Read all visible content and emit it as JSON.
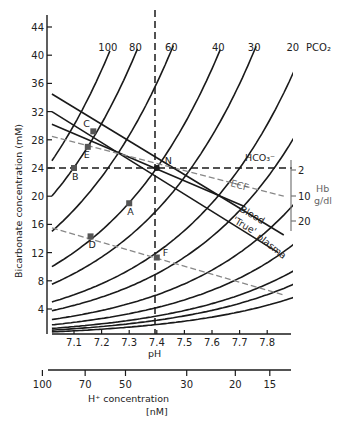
{
  "chart_data": {
    "type": "line",
    "title": "",
    "xlabel": "pH",
    "ylabel": "Bicarbonate concentration (mM)",
    "secondary_xlabel": "H⁺ concentration",
    "secondary_xlabel_unit": "[nM]",
    "xlim": [
      7.0,
      7.9
    ],
    "ylim": [
      0,
      46
    ],
    "x_ticks": [
      7.1,
      7.2,
      7.3,
      7.4,
      7.5,
      7.6,
      7.7,
      7.8
    ],
    "y_ticks": [
      4,
      8,
      12,
      16,
      20,
      24,
      28,
      32,
      36,
      40,
      44
    ],
    "h_ion_ticks": [
      100,
      70,
      50,
      30,
      20,
      15
    ],
    "grid": false,
    "isopleth_label": "PCO₂",
    "series": [
      {
        "name": "PCO2 100",
        "pco2": 100,
        "labeled": true
      },
      {
        "name": "PCO2 80",
        "pco2": 80,
        "labeled": true
      },
      {
        "name": "PCO2 60",
        "pco2": 60,
        "labeled": true
      },
      {
        "name": "PCO2 40",
        "pco2": 40,
        "labeled": true
      },
      {
        "name": "PCO2 30",
        "pco2": 30,
        "labeled": true
      },
      {
        "name": "PCO2 20",
        "pco2": 20,
        "labeled": true
      },
      {
        "name": "PCO2 15",
        "pco2": 15,
        "labeled": false
      },
      {
        "name": "PCO2 10",
        "pco2": 10,
        "labeled": false
      },
      {
        "name": "PCO2 7",
        "pco2": 7,
        "labeled": false
      },
      {
        "name": "PCO2 5",
        "pco2": 5,
        "labeled": false
      },
      {
        "name": "PCO2 4",
        "pco2": 4,
        "labeled": false
      },
      {
        "name": "PCO2 3",
        "pco2": 3,
        "labeled": false
      }
    ],
    "buffer_lines": [
      {
        "name": "Blood",
        "style": "solid",
        "from": [
          7.02,
          34.5
        ],
        "to": [
          7.86,
          14.5
        ]
      },
      {
        "name": "'True' plasma",
        "style": "solid",
        "from": [
          7.02,
          32.0
        ],
        "to": [
          7.84,
          12.0
        ]
      },
      {
        "name": "HCO3-",
        "style": "solid",
        "from": [
          7.02,
          30.2
        ],
        "to": [
          7.72,
          18.5
        ]
      },
      {
        "name": "ECF",
        "style": "dashed-grey",
        "from": [
          7.02,
          28.5
        ],
        "to": [
          7.86,
          20.0
        ]
      },
      {
        "name": "Metabolic line",
        "style": "dashed-grey",
        "from": [
          7.02,
          15.5
        ],
        "to": [
          7.86,
          6.0
        ]
      }
    ],
    "reference_lines": {
      "pH": 7.4,
      "HCO3": 24
    },
    "points": [
      {
        "label": "N",
        "pH": 7.4,
        "HCO3": 24.0
      },
      {
        "label": "A",
        "pH": 7.3,
        "HCO3": 19.0
      },
      {
        "label": "B",
        "pH": 7.1,
        "HCO3": 24.0
      },
      {
        "label": "C",
        "pH": 7.17,
        "HCO3": 29.2
      },
      {
        "label": "D",
        "pH": 7.16,
        "HCO3": 14.3
      },
      {
        "label": "E",
        "pH": 7.15,
        "HCO3": 27.0
      },
      {
        "label": "F",
        "pH": 7.4,
        "HCO3": 11.3
      }
    ],
    "hb_scale": {
      "label": "Hb",
      "unit": "g/dl",
      "ticks": [
        2,
        10,
        20
      ]
    },
    "annotations": [
      "HCO₃⁻",
      "ECF",
      "Blood",
      "'True' plasma",
      "N",
      "A",
      "B",
      "C",
      "D",
      "E",
      "F"
    ]
  },
  "labels": {
    "pco2_title": "PCO₂",
    "hco3": "HCO₃⁻",
    "ecf": "ECF",
    "blood": "Blood",
    "true_plasma_1": "'True'",
    "true_plasma_2": "plasma",
    "hb": "Hb",
    "hb_unit": "g/dl",
    "y_axis": "Bicarbonate concentration (mM)",
    "x_axis": "pH",
    "h_axis": "H⁺ concentration",
    "h_axis_unit": "[nM]"
  },
  "colors": {
    "ink": "#1a1a1a",
    "grey_line": "#888888",
    "point": "#555555"
  }
}
